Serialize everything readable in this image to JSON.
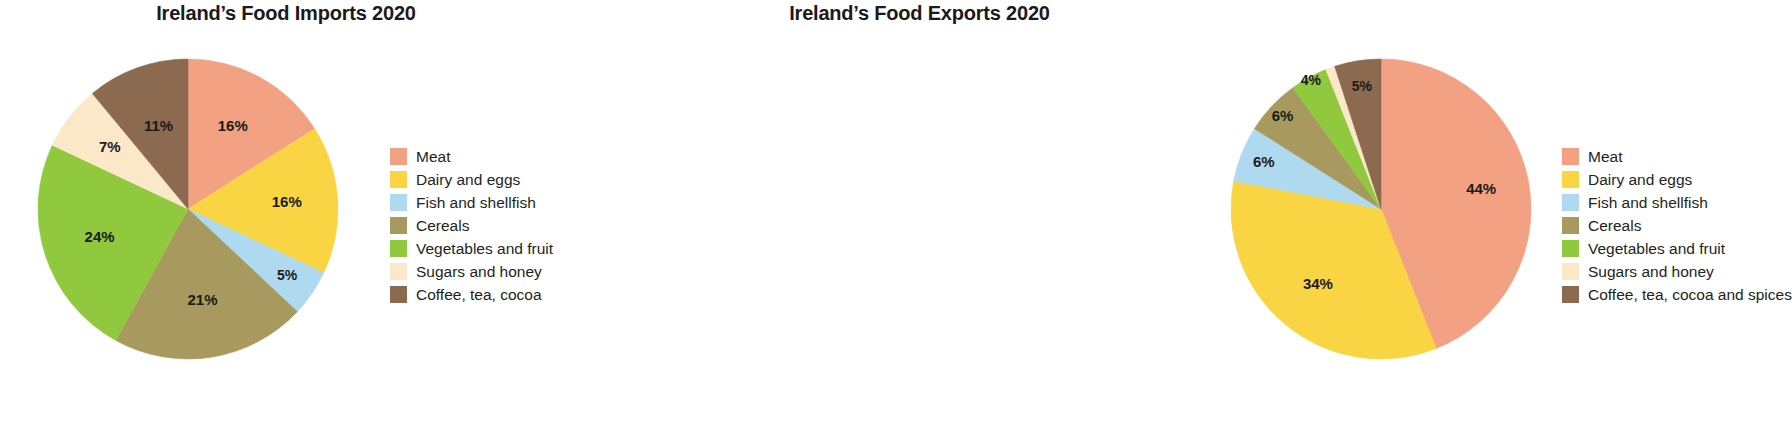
{
  "chart_data": [
    {
      "type": "pie",
      "id": "imports",
      "title": "Ireland’s Food Imports 2020",
      "categories": [
        "Meat",
        "Dairy and eggs",
        "Fish and shellfish",
        "Cereals",
        "Vegetables and fruit",
        "Sugars and honey",
        "Coffee, tea, cocoa"
      ],
      "values": [
        16,
        16,
        5,
        21,
        24,
        7,
        11
      ],
      "value_labels": [
        "16%",
        "16%",
        "5%",
        "21%",
        "24%",
        "7%",
        "11%"
      ],
      "colors": [
        "#F2A183",
        "#F9D543",
        "#AFD9EF",
        "#A89A5E",
        "#90C93E",
        "#FAE8C8",
        "#8B6A50"
      ],
      "legend_position": "right",
      "start_angle_deg": 0,
      "direction": "clockwise",
      "units": "percent"
    },
    {
      "type": "pie",
      "id": "exports",
      "title": "Ireland’s Food Exports 2020",
      "categories": [
        "Meat",
        "Dairy and eggs",
        "Fish and shellfish",
        "Cereals",
        "Vegetables and fruit",
        "Sugars and honey",
        "Coffee, tea, cocoa and spices"
      ],
      "values": [
        44,
        34,
        6,
        6,
        4,
        1,
        5
      ],
      "value_labels": [
        "44%",
        "34%",
        "6%",
        "6%",
        "4%",
        "1%",
        "5%"
      ],
      "colors": [
        "#F2A183",
        "#F9D543",
        "#AFD9EF",
        "#A89A5E",
        "#90C93E",
        "#FAE8C8",
        "#8B6A50"
      ],
      "legend_position": "right",
      "start_angle_deg": 0,
      "direction": "clockwise",
      "units": "percent"
    }
  ],
  "palette": {
    "meat": "#F2A183",
    "dairy_and_eggs": "#F9D543",
    "fish_and_shellfish": "#AFD9EF",
    "cereals": "#A89A5E",
    "vegetables_and_fruit": "#90C93E",
    "sugars_and_honey": "#FAE8C8",
    "coffee_tea_cocoa": "#8B6A50",
    "background": "#FFFFFF",
    "text": "#231F20"
  }
}
